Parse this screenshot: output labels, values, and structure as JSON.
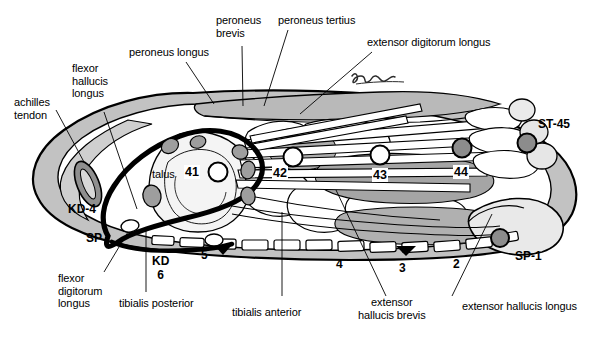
{
  "figure": {
    "signature": "script-signature",
    "colors": {
      "outline": "#000000",
      "skin_shade": "#c2c2c2",
      "muscle_shade": "#9a9a9a",
      "bone_fill": "#f2f2f2",
      "point_open_fill": "#ffffff",
      "point_filled_fill": "#8c8c8c",
      "meridian": "#000000",
      "background": "#ffffff"
    }
  },
  "labels": {
    "achilles_tendon": "achilles\ntendon",
    "flexor_hallucis_longus": "flexor\nhallucis\nlongus",
    "peroneus_longus": "peroneus longus",
    "peroneus_brevis": "peroneus\nbrevis",
    "peroneus_tertius": "peroneus tertius",
    "extensor_digitorum_longus": "extensor digitorum longus",
    "talus": "talus",
    "flexor_digitorum_longus": "flexor\ndigitorum\nlongus",
    "tibialis_posterior": "tibialis posterior",
    "tibialis_anterior": "tibialis anterior",
    "extensor_hallucis_brevis": "extensor\nhallucis brevis",
    "extensor_hallucis_longus": "extensor hallucis longus"
  },
  "acupoints": {
    "meridian_points": [
      {
        "id": "ST-41",
        "number": "41",
        "fill": "open",
        "x": 218,
        "y": 172
      },
      {
        "id": "ST-42",
        "number": "42",
        "fill": "open",
        "x": 293,
        "y": 157
      },
      {
        "id": "ST-43",
        "number": "43",
        "fill": "open",
        "x": 380,
        "y": 155
      },
      {
        "id": "ST-44",
        "number": "44",
        "fill": "filled",
        "x": 462,
        "y": 148
      },
      {
        "id": "ST-45",
        "number": "",
        "fill": "filled",
        "x": 527,
        "y": 143
      }
    ],
    "named_points": [
      {
        "label": "ST-45",
        "x": 546,
        "y": 124
      },
      {
        "label": "SP-1",
        "x": 520,
        "y": 257
      },
      {
        "label": "KD-4",
        "x": 74,
        "y": 210
      },
      {
        "label": "SP",
        "x": 91,
        "y": 239
      },
      {
        "label": "KD\n6",
        "x": 161,
        "y": 261
      },
      {
        "label": "5",
        "x": 205,
        "y": 256
      },
      {
        "label": "4",
        "x": 339,
        "y": 265
      },
      {
        "label": "3",
        "x": 402,
        "y": 269
      },
      {
        "label": "2",
        "x": 456,
        "y": 265
      }
    ]
  },
  "leader_lines": [
    {
      "name": "achilles-tendon-leader",
      "x1": 56,
      "y1": 110,
      "x2": 84,
      "y2": 160
    },
    {
      "name": "flexor-hallucis-longus-leader",
      "x1": 104,
      "y1": 112,
      "x2": 137,
      "y2": 209
    },
    {
      "name": "peroneus-longus-leader",
      "x1": 186,
      "y1": 62,
      "x2": 212,
      "y2": 103
    },
    {
      "name": "peroneus-brevis-leader",
      "x1": 242,
      "y1": 46,
      "x2": 243,
      "y2": 105
    },
    {
      "name": "peroneus-tertius-leader",
      "x1": 286,
      "y1": 30,
      "x2": 265,
      "y2": 105
    },
    {
      "name": "extensor-digitorum-longus-leader",
      "x1": 372,
      "y1": 50,
      "x2": 300,
      "y2": 112
    },
    {
      "name": "flexor-digitorum-longus-leader",
      "x1": 104,
      "y1": 272,
      "x2": 127,
      "y2": 234
    },
    {
      "name": "tibialis-posterior-leader",
      "x1": 145,
      "y1": 292,
      "x2": 145,
      "y2": 232
    },
    {
      "name": "tibialis-anterior-leader",
      "x1": 282,
      "y1": 296,
      "x2": 282,
      "y2": 215
    },
    {
      "name": "extensor-hallucis-brevis-leader",
      "x1": 384,
      "y1": 296,
      "x2": 336,
      "y2": 193
    },
    {
      "name": "extensor-hallucis-longus-leader",
      "x1": 452,
      "y1": 296,
      "x2": 492,
      "y2": 216
    }
  ]
}
